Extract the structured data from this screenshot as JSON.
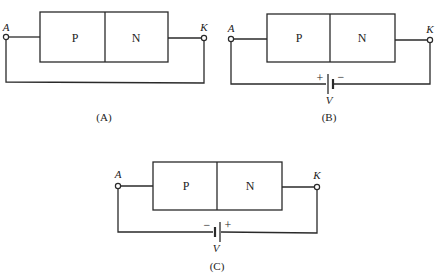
{
  "diagrams": [
    {
      "caption": "(A)",
      "p_label": "P",
      "n_label": "N",
      "anode_label": "A",
      "cathode_label": "K",
      "has_battery": false
    },
    {
      "caption": "(B)",
      "p_label": "P",
      "n_label": "N",
      "anode_label": "A",
      "cathode_label": "K",
      "has_battery": true,
      "battery": {
        "left_sign": "+",
        "right_sign": "−",
        "label": "V"
      }
    },
    {
      "caption": "(C)",
      "p_label": "P",
      "n_label": "N",
      "anode_label": "A",
      "cathode_label": "K",
      "has_battery": true,
      "battery": {
        "left_sign": "−",
        "right_sign": "+",
        "label": "V"
      }
    }
  ]
}
